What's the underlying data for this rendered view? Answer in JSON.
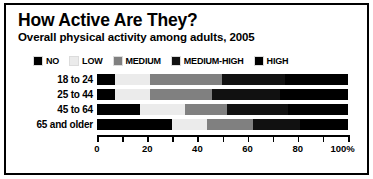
{
  "chart_data": {
    "type": "bar",
    "orientation": "horizontal",
    "stacked": true,
    "stack_mode": "percent",
    "title": "How Active Are They?",
    "subtitle": "Overall physical activity among adults, 2005",
    "xlabel": "",
    "ylabel": "",
    "xlim": [
      0,
      100
    ],
    "grid": false,
    "legend_position": "top",
    "categories": [
      "18 to 24",
      "25 to 44",
      "45 to 64",
      "65 and older"
    ],
    "series": [
      {
        "name": "NO",
        "color": "#000000",
        "values": [
          7,
          7,
          17,
          30
        ]
      },
      {
        "name": "LOW",
        "color": "#ebebeb",
        "values": [
          14,
          14,
          18,
          14
        ]
      },
      {
        "name": "MEDIUM",
        "color": "#808080",
        "values": [
          29,
          25,
          17,
          18
        ]
      },
      {
        "name": "MEDIUM-HIGH",
        "color": "#111111",
        "values": [
          25,
          27,
          24,
          19
        ]
      },
      {
        "name": "HIGH",
        "color": "#000000",
        "values": [
          25,
          27,
          24,
          19
        ]
      }
    ],
    "xticks": [
      0,
      10,
      20,
      30,
      40,
      50,
      60,
      70,
      80,
      90,
      100
    ],
    "xtick_labels": [
      "0",
      "",
      "20",
      "",
      "40",
      "",
      "60",
      "",
      "80",
      "",
      "100%"
    ]
  },
  "legend": {
    "items": [
      {
        "label": "NO",
        "swatch": "#000000"
      },
      {
        "label": "LOW",
        "swatch": "#ebebeb"
      },
      {
        "label": "MEDIUM",
        "swatch": "#808080"
      },
      {
        "label": "MEDIUM-HIGH",
        "swatch": "#111111"
      },
      {
        "label": "HIGH",
        "swatch": "#000000"
      }
    ]
  }
}
